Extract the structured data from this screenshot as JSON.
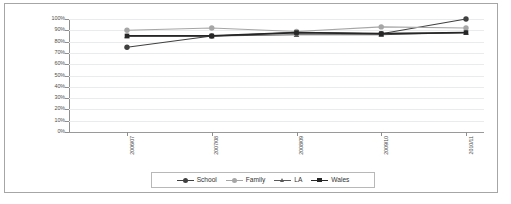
{
  "chart_data": {
    "type": "line",
    "title": "",
    "xlabel": "",
    "ylabel": "",
    "ylim": [
      0,
      1.0
    ],
    "ytick_labels": [
      "100%",
      "90%",
      "80%",
      "70%",
      "60%",
      "50%",
      "40%",
      "30%",
      "20%",
      "10%",
      "0%"
    ],
    "ytick_values": [
      100,
      90,
      80,
      70,
      60,
      50,
      40,
      30,
      20,
      10,
      0
    ],
    "categories": [
      "2006/07",
      "2007/08",
      "2008/09",
      "2009/10",
      "2010/11"
    ],
    "grid": true,
    "legend_position": "bottom",
    "series": [
      {
        "name": "School",
        "color": "#404040",
        "marker": "circle",
        "values": [
          75,
          85,
          88,
          87,
          100
        ]
      },
      {
        "name": "Family",
        "color": "#a6a6a6",
        "marker": "circle",
        "values": [
          90,
          92,
          89,
          93,
          92
        ]
      },
      {
        "name": "LA",
        "color": "#595959",
        "marker": "triangle",
        "values": [
          85,
          85,
          86,
          86,
          88
        ]
      },
      {
        "name": "Wales",
        "color": "#262626",
        "marker": "square",
        "values": [
          85,
          85,
          88,
          87,
          88
        ]
      }
    ]
  },
  "legend": {
    "items": [
      {
        "label": "School"
      },
      {
        "label": "Family"
      },
      {
        "label": "LA"
      },
      {
        "label": "Wales"
      }
    ]
  },
  "colors": {
    "frame_border": "#a6a6a6",
    "gridline": "#e9ebec",
    "axis": "#8f8f8f",
    "tick_text": "#4d4d4d",
    "legend_border": "#b8b8b8",
    "background": "#ffffff"
  }
}
